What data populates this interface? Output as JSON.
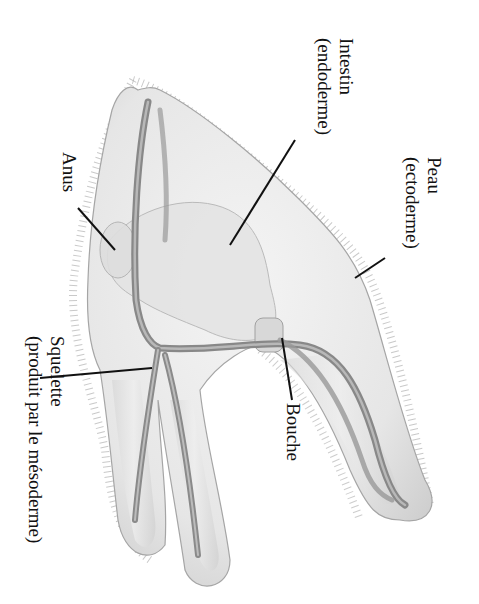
{
  "diagram": {
    "labels": {
      "intestin": {
        "line1": "Intestin",
        "line2": "(endoderme)"
      },
      "peau": {
        "line1": "Peau",
        "line2": "(ectoderme)"
      },
      "anus": {
        "line1": "Anus"
      },
      "squelette": {
        "line1": "Squelette",
        "line2": "(produit par le mésoderme)"
      },
      "bouche": {
        "line1": "Bouche"
      }
    },
    "colors": {
      "background": "#ffffff",
      "body_fill": "#ececec",
      "body_outline": "#9a9a9a",
      "skeleton": "#8c8c8c",
      "gut": "#e2e2e2",
      "leader_lines": "#111111",
      "text": "#111111"
    }
  }
}
